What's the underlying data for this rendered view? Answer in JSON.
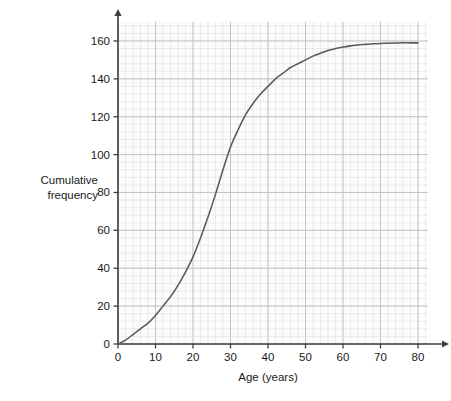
{
  "chart_data": {
    "type": "line",
    "title": "",
    "subtitle": "",
    "xlabel": "Age (years)",
    "ylabel": "Cumulative frequency",
    "ylabel_line1": "Cumulative",
    "ylabel_line2": "frequency",
    "xlim": [
      0,
      80
    ],
    "ylim": [
      0,
      160
    ],
    "xticks": [
      0,
      10,
      20,
      30,
      40,
      50,
      60,
      70,
      80
    ],
    "xtick_labels": [
      "0",
      "10",
      "20",
      "30",
      "40",
      "50",
      "60",
      "70",
      "80"
    ],
    "yticks": [
      0,
      20,
      40,
      60,
      80,
      100,
      120,
      140,
      160
    ],
    "ytick_labels": [
      "0",
      "20",
      "40",
      "60",
      "80",
      "100",
      "120",
      "140",
      "160"
    ],
    "grid": true,
    "grid_minor": true,
    "grid_minor_step_x": 2,
    "grid_minor_step_y": 4,
    "legend": null,
    "legend_position": "none",
    "axis_arrows": true,
    "series": [
      {
        "name": "Cumulative frequency",
        "color": "#5a5a5a",
        "x": [
          0,
          2,
          4,
          6,
          8,
          10,
          12,
          14,
          16,
          18,
          20,
          22,
          24,
          26,
          28,
          30,
          32,
          34,
          36,
          38,
          40,
          42,
          44,
          46,
          48,
          50,
          52,
          54,
          56,
          58,
          60,
          62,
          64,
          66,
          68,
          70,
          72,
          74,
          76,
          78,
          80
        ],
        "y": [
          0,
          2,
          5,
          8,
          11,
          15,
          20,
          25,
          31,
          38,
          46,
          56,
          67,
          79,
          92,
          104,
          113,
          121,
          127,
          132,
          136,
          140,
          143,
          146,
          148,
          150,
          152,
          153.5,
          155,
          156,
          156.8,
          157.4,
          157.9,
          158.2,
          158.5,
          158.7,
          158.8,
          158.9,
          159,
          159,
          159
        ]
      }
    ],
    "colors": {
      "curve": "#5a5a5a",
      "axis": "#3f3f3f",
      "grid_major": "#bcbcc4",
      "grid_minor": "#e2e2e8",
      "plot_background": "#fcfcfd",
      "text": "#1a1a1a"
    },
    "annotations": []
  }
}
